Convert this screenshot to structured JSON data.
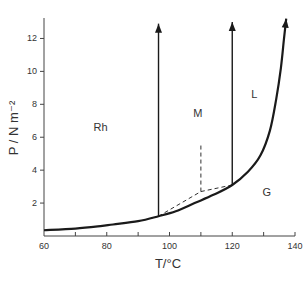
{
  "chart_data": {
    "type": "line",
    "title": "",
    "xlabel": "T/°C",
    "ylabel": "P / N m⁻²",
    "xlim": [
      60,
      140
    ],
    "ylim": [
      0,
      13
    ],
    "x_ticks": [
      60,
      70,
      80,
      90,
      100,
      110,
      120,
      130,
      140
    ],
    "x_tick_labels": [
      "60",
      "80",
      "100",
      "120",
      "140"
    ],
    "x_tick_label_values": [
      60,
      80,
      100,
      120,
      140
    ],
    "y_ticks": [
      2,
      4,
      6,
      8,
      10,
      12
    ],
    "y_tick_labels": [
      "2",
      "4",
      "6",
      "8",
      "10",
      "12"
    ],
    "grid": false,
    "series": [
      {
        "name": "sublimation/vaporization curve",
        "style": "solid-bold",
        "x": [
          60,
          70,
          78,
          82,
          90,
          96.5,
          102,
          108,
          114,
          120,
          125,
          129,
          132,
          134,
          135.5,
          136.5,
          137.2
        ],
        "y": [
          0.35,
          0.45,
          0.6,
          0.7,
          0.9,
          1.2,
          1.5,
          2.0,
          2.5,
          3.1,
          3.9,
          4.9,
          6.4,
          8.3,
          10.2,
          12.0,
          13.2
        ],
        "arrow_end": true
      },
      {
        "name": "Rh-M boundary",
        "style": "solid",
        "x": [
          96.5,
          96.5
        ],
        "y": [
          1.2,
          12.9
        ],
        "arrow_end": true
      },
      {
        "name": "M-L boundary",
        "style": "solid",
        "x": [
          120,
          120
        ],
        "y": [
          3.1,
          13.0
        ],
        "arrow_end": true
      },
      {
        "name": "metastable extension (lower)",
        "style": "dashed",
        "x": [
          96.5,
          110,
          120
        ],
        "y": [
          1.2,
          2.7,
          3.1
        ]
      },
      {
        "name": "metastable extension (vertical)",
        "style": "dashed",
        "x": [
          110,
          110
        ],
        "y": [
          2.7,
          5.6
        ]
      }
    ],
    "annotations": [
      {
        "text": "Rh",
        "x": 78,
        "y": 6.4
      },
      {
        "text": "M",
        "x": 109,
        "y": 7.2
      },
      {
        "text": "L",
        "x": 127,
        "y": 8.4
      },
      {
        "text": "G",
        "x": 131,
        "y": 2.4
      }
    ]
  }
}
